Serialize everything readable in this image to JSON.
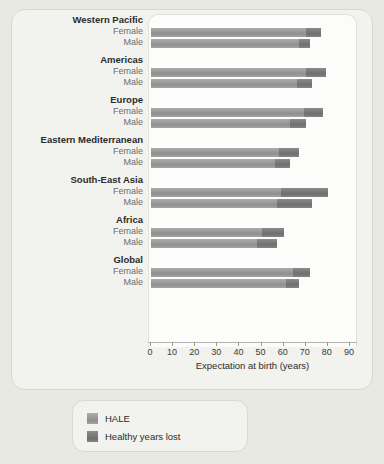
{
  "chart_data": {
    "type": "bar",
    "orientation": "horizontal",
    "stacked": true,
    "title": "",
    "xlabel": "Expectation at birth (years)",
    "ylabel": "",
    "xlim": [
      0,
      90
    ],
    "xticks": [
      0,
      10,
      20,
      30,
      40,
      50,
      60,
      70,
      80,
      90
    ],
    "xticklabels": [
      "0",
      "10",
      "20",
      "30",
      "40",
      "50",
      "60",
      "70",
      "80",
      "90"
    ],
    "grid": false,
    "legend": {
      "position": "below",
      "entries": [
        {
          "label": "HALE",
          "color": "#9b9b9b",
          "key": "hale"
        },
        {
          "label": "Healthy years lost",
          "color": "#7a7a7a",
          "key": "lost"
        }
      ]
    },
    "series": [
      {
        "name": "HALE",
        "color": "#9b9b9b"
      },
      {
        "name": "Healthy years lost",
        "color": "#7a7a7a"
      }
    ],
    "groups": [
      {
        "region": "Western Pacific",
        "rows": [
          {
            "sex": "Female",
            "hale": 70,
            "lost": 7,
            "total": 77
          },
          {
            "sex": "Male",
            "hale": 67,
            "lost": 5,
            "total": 72
          }
        ]
      },
      {
        "region": "Americas",
        "rows": [
          {
            "sex": "Female",
            "hale": 70,
            "lost": 9,
            "total": 79
          },
          {
            "sex": "Male",
            "hale": 66,
            "lost": 7,
            "total": 73
          }
        ]
      },
      {
        "region": "Europe",
        "rows": [
          {
            "sex": "Female",
            "hale": 69,
            "lost": 9,
            "total": 78
          },
          {
            "sex": "Male",
            "hale": 63,
            "lost": 7,
            "total": 70
          }
        ]
      },
      {
        "region": "Eastern Mediterranean",
        "rows": [
          {
            "sex": "Female",
            "hale": 58,
            "lost": 9,
            "total": 67
          },
          {
            "sex": "Male",
            "hale": 56,
            "lost": 7,
            "total": 63
          }
        ]
      },
      {
        "region": "South-East Asia",
        "rows": [
          {
            "sex": "Female",
            "hale": 59,
            "lost": 21,
            "total": 80
          },
          {
            "sex": "Male",
            "hale": 57,
            "lost": 16,
            "total": 73
          }
        ]
      },
      {
        "region": "Africa",
        "rows": [
          {
            "sex": "Female",
            "hale": 50,
            "lost": 10,
            "total": 60
          },
          {
            "sex": "Male",
            "hale": 48,
            "lost": 9,
            "total": 57
          }
        ]
      },
      {
        "region": "Global",
        "rows": [
          {
            "sex": "Female",
            "hale": 64,
            "lost": 8,
            "total": 72
          },
          {
            "sex": "Male",
            "hale": 61,
            "lost": 6,
            "total": 67
          }
        ]
      }
    ]
  }
}
